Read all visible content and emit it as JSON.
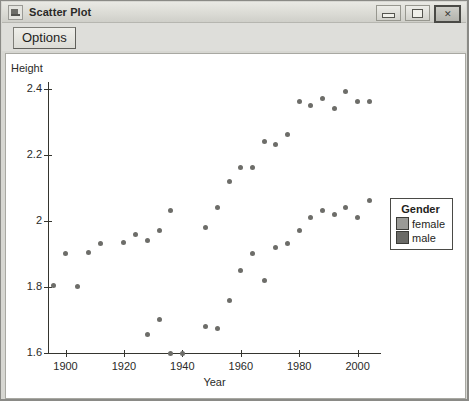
{
  "window": {
    "title": "Scatter Plot",
    "icon": "app-icon",
    "buttons": [
      {
        "name": "minimize-button",
        "glyph": "minimize",
        "focused": false
      },
      {
        "name": "maximize-button",
        "glyph": "maximize",
        "focused": false
      },
      {
        "name": "close-button",
        "glyph": "✕",
        "focused": true
      }
    ]
  },
  "toolbar": {
    "options_label": "Options"
  },
  "legend": {
    "title": "Gender",
    "entries": [
      {
        "label": "female",
        "color": "#9a9a96"
      },
      {
        "label": "male",
        "color": "#6a6a66"
      }
    ]
  },
  "chart_data": {
    "type": "scatter",
    "title": "",
    "xlabel": "Year",
    "ylabel": "Height",
    "xlim": [
      1894,
      2008
    ],
    "ylim": [
      1.6,
      2.42
    ],
    "xticks": [
      1900,
      1920,
      1940,
      1960,
      1980,
      2000
    ],
    "yticks": [
      "1.6",
      "1.8",
      "2",
      "2.2",
      "2.4"
    ],
    "ytick_values": [
      1.6,
      1.8,
      2.0,
      2.2,
      2.4
    ],
    "grid": false,
    "legend_position": "right",
    "point_color": "#6d6d69",
    "series": [
      {
        "name": "female",
        "color": "#9a9a96",
        "points": [
          [
            1896,
            1.805
          ],
          [
            1900,
            1.9
          ],
          [
            1904,
            1.8
          ],
          [
            1908,
            1.905
          ],
          [
            1912,
            1.93
          ],
          [
            1920,
            1.935
          ],
          [
            1924,
            1.96
          ],
          [
            1928,
            1.94
          ],
          [
            1932,
            1.97
          ],
          [
            1936,
            2.03
          ],
          [
            1948,
            1.98
          ],
          [
            1952,
            2.04
          ],
          [
            1956,
            2.12
          ],
          [
            1960,
            2.16
          ],
          [
            1964,
            2.16
          ],
          [
            1968,
            2.24
          ],
          [
            1972,
            2.23
          ],
          [
            1976,
            2.26
          ],
          [
            1980,
            2.36
          ],
          [
            1984,
            2.35
          ],
          [
            1988,
            2.37
          ],
          [
            1992,
            2.34
          ],
          [
            1996,
            2.39
          ],
          [
            2000,
            2.36
          ],
          [
            2004,
            2.36
          ]
        ]
      },
      {
        "name": "male",
        "color": "#6a6a66",
        "points": [
          [
            1928,
            1.655
          ],
          [
            1932,
            1.7
          ],
          [
            1936,
            1.6
          ],
          [
            1940,
            1.6
          ],
          [
            1948,
            1.68
          ],
          [
            1952,
            1.675
          ],
          [
            1956,
            1.76
          ],
          [
            1960,
            1.85
          ],
          [
            1964,
            1.9
          ],
          [
            1968,
            1.82
          ],
          [
            1972,
            1.92
          ],
          [
            1976,
            1.93
          ],
          [
            1980,
            1.97
          ],
          [
            1984,
            2.01
          ],
          [
            1988,
            2.03
          ],
          [
            1992,
            2.02
          ],
          [
            1996,
            2.04
          ],
          [
            2000,
            2.01
          ],
          [
            2004,
            2.06
          ]
        ]
      }
    ]
  }
}
